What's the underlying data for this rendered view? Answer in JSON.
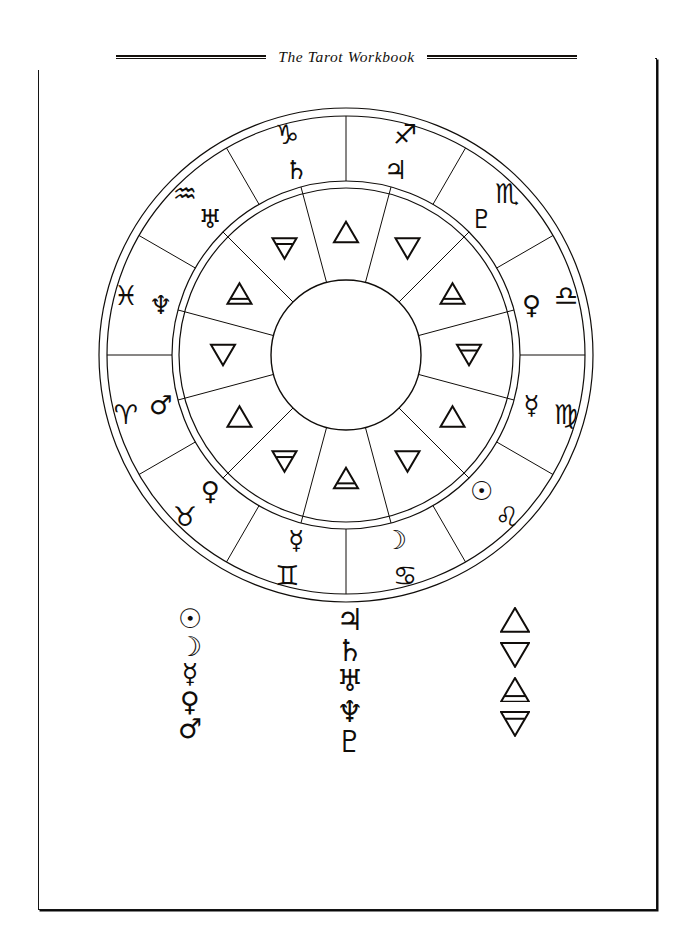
{
  "page": {
    "running_head": "The Tarot Workbook",
    "background_color": "#ffffff",
    "ink_color": "#100d0a"
  },
  "wheel": {
    "name": "zodiac-wheel",
    "segment_count": 12,
    "outer_ring": [
      {
        "position": 1,
        "sign_name": "Sagittarius",
        "sign_glyph": "♐",
        "ruler_name": "Jupiter",
        "ruler_glyph": "♃"
      },
      {
        "position": 2,
        "sign_name": "Scorpio",
        "sign_glyph": "♏",
        "ruler_name": "Pluto",
        "ruler_glyph": "♇"
      },
      {
        "position": 3,
        "sign_name": "Libra",
        "sign_glyph": "♎",
        "ruler_name": "Venus",
        "ruler_glyph": "♀"
      },
      {
        "position": 4,
        "sign_name": "Virgo",
        "sign_glyph": "♍",
        "ruler_name": "Mercury",
        "ruler_glyph": "☿"
      },
      {
        "position": 5,
        "sign_name": "Leo",
        "sign_glyph": "♌",
        "ruler_name": "Sun",
        "ruler_glyph": "☉"
      },
      {
        "position": 6,
        "sign_name": "Cancer",
        "sign_glyph": "♋",
        "ruler_name": "Moon",
        "ruler_glyph": "☽"
      },
      {
        "position": 7,
        "sign_name": "Gemini",
        "sign_glyph": "♊",
        "ruler_name": "Mercury",
        "ruler_glyph": "☿"
      },
      {
        "position": 8,
        "sign_name": "Taurus",
        "sign_glyph": "♉",
        "ruler_name": "Venus",
        "ruler_glyph": "♀"
      },
      {
        "position": 9,
        "sign_name": "Aries",
        "sign_glyph": "♈",
        "ruler_name": "Mars",
        "ruler_glyph": "♂"
      },
      {
        "position": 10,
        "sign_name": "Pisces",
        "sign_glyph": "♓",
        "ruler_name": "Neptune",
        "ruler_glyph": "♆"
      },
      {
        "position": 11,
        "sign_name": "Aquarius",
        "sign_glyph": "♒",
        "ruler_name": "Uranus",
        "ruler_glyph": "♅"
      },
      {
        "position": 12,
        "sign_name": "Capricorn",
        "sign_glyph": "♑",
        "ruler_name": "Saturn",
        "ruler_glyph": "♄"
      }
    ],
    "inner_ring": [
      {
        "position": 1,
        "element": "Fire",
        "shape": "triangle-up"
      },
      {
        "position": 2,
        "element": "Water",
        "shape": "triangle-down"
      },
      {
        "position": 3,
        "element": "Air",
        "shape": "triangle-up-bar"
      },
      {
        "position": 4,
        "element": "Earth",
        "shape": "triangle-down-bar"
      },
      {
        "position": 5,
        "element": "Fire",
        "shape": "triangle-up"
      },
      {
        "position": 6,
        "element": "Water",
        "shape": "triangle-down"
      },
      {
        "position": 7,
        "element": "Air",
        "shape": "triangle-up-bar"
      },
      {
        "position": 8,
        "element": "Earth",
        "shape": "triangle-down-bar"
      },
      {
        "position": 9,
        "element": "Fire",
        "shape": "triangle-up"
      },
      {
        "position": 10,
        "element": "Water",
        "shape": "triangle-down"
      },
      {
        "position": 11,
        "element": "Air",
        "shape": "triangle-up-bar"
      },
      {
        "position": 12,
        "element": "Earth",
        "shape": "triangle-down-bar"
      }
    ]
  },
  "legend": {
    "personal_planets": [
      {
        "name": "Sun",
        "glyph": "☉"
      },
      {
        "name": "Moon",
        "glyph": "☽"
      },
      {
        "name": "Mercury",
        "glyph": "☿"
      },
      {
        "name": "Venus",
        "glyph": "♀"
      },
      {
        "name": "Mars",
        "glyph": "♂"
      }
    ],
    "outer_planets": [
      {
        "name": "Jupiter",
        "glyph": "♃"
      },
      {
        "name": "Saturn",
        "glyph": "♄"
      },
      {
        "name": "Uranus",
        "glyph": "♅"
      },
      {
        "name": "Neptune",
        "glyph": "♆"
      },
      {
        "name": "Pluto",
        "glyph": "♇"
      }
    ],
    "elements": [
      {
        "name": "Fire",
        "shape": "triangle-up"
      },
      {
        "name": "Water",
        "shape": "triangle-down"
      },
      {
        "name": "Air",
        "shape": "triangle-up-bar"
      },
      {
        "name": "Earth",
        "shape": "triangle-down-bar"
      }
    ]
  }
}
